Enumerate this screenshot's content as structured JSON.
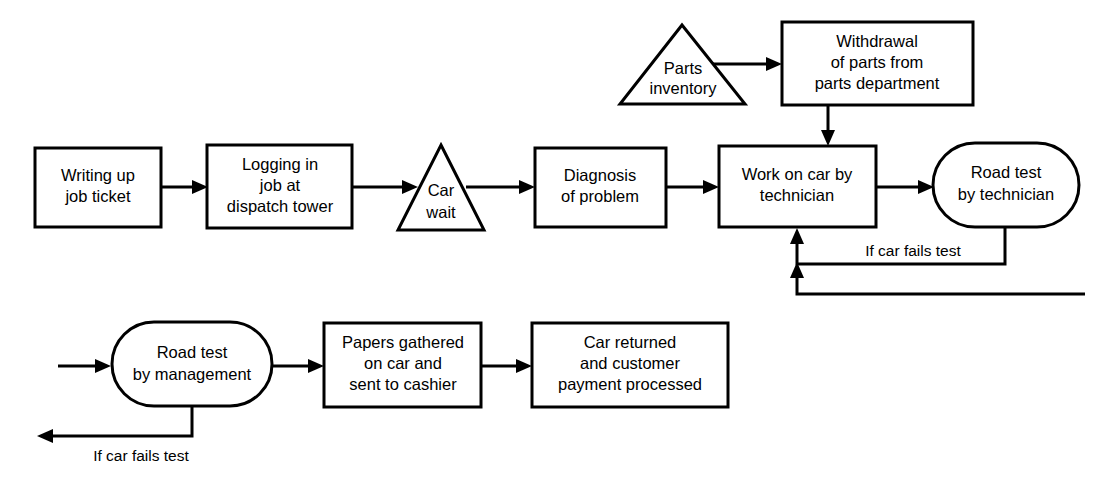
{
  "diagram": {
    "type": "flowchart",
    "title": "",
    "background_color": "#ffffff",
    "line_color": "#000000",
    "nodes": [
      {
        "id": "writing-up-job-ticket",
        "shape": "rectangle",
        "lines": [
          "Writing up",
          "job ticket"
        ]
      },
      {
        "id": "logging-in-job",
        "shape": "rectangle",
        "lines": [
          "Logging in",
          "job at",
          "dispatch tower"
        ]
      },
      {
        "id": "car-wait",
        "shape": "triangle",
        "lines": [
          "Car",
          "wait"
        ]
      },
      {
        "id": "diagnosis-of-problem",
        "shape": "rectangle",
        "lines": [
          "Diagnosis",
          "of problem"
        ]
      },
      {
        "id": "work-on-car",
        "shape": "rectangle",
        "lines": [
          "Work on car by",
          "technician"
        ]
      },
      {
        "id": "road-test-technician",
        "shape": "stadium",
        "lines": [
          "Road test",
          "by technician"
        ]
      },
      {
        "id": "parts-inventory",
        "shape": "triangle",
        "lines": [
          "Parts",
          "inventory"
        ]
      },
      {
        "id": "withdrawal-of-parts",
        "shape": "rectangle",
        "lines": [
          "Withdrawal",
          "of parts from",
          "parts department"
        ]
      },
      {
        "id": "road-test-management",
        "shape": "stadium",
        "lines": [
          "Road test",
          "by management"
        ]
      },
      {
        "id": "papers-gathered",
        "shape": "rectangle",
        "lines": [
          "Papers gathered",
          "on car and",
          "sent to cashier"
        ]
      },
      {
        "id": "car-returned",
        "shape": "rectangle",
        "lines": [
          "Car returned",
          "and customer",
          "payment processed"
        ]
      }
    ],
    "edge_labels": [
      {
        "id": "fails-test-technician",
        "text": "If car fails test"
      },
      {
        "id": "fails-test-management",
        "text": "If car fails test"
      }
    ]
  }
}
